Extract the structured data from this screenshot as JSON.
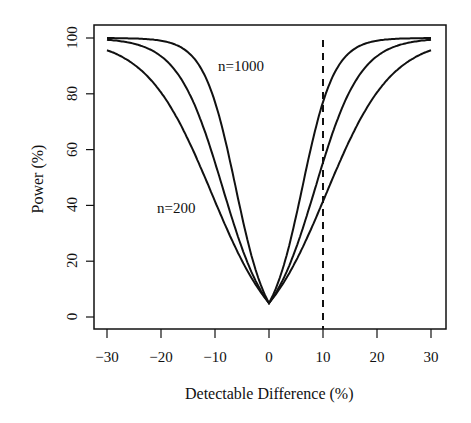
{
  "chart_data": {
    "type": "line",
    "title": "",
    "xlabel": "Detectable Difference (%)",
    "ylabel": "Power (%)",
    "xlim": [
      -31.5,
      33
    ],
    "ylim": [
      -4,
      105
    ],
    "xticks": [
      "-30",
      "-20",
      "-10",
      "0",
      "10",
      "20",
      "30"
    ],
    "yticks": [
      "0",
      "20",
      "40",
      "60",
      "80",
      "100"
    ],
    "grid": false,
    "legend": null,
    "annotations": [
      {
        "text": "n=1000",
        "x": -6,
        "y": 92
      },
      {
        "text": "n=200",
        "x": -13,
        "y": 43
      },
      {
        "type": "vline",
        "x": 10,
        "style": "dashed"
      }
    ],
    "x": [
      -30,
      -25,
      -20,
      -15,
      -10,
      -5,
      0,
      5,
      10,
      15,
      20,
      25,
      30
    ],
    "series": [
      {
        "name": "n=200",
        "values": [
          100,
          99,
          93,
          75,
          50,
          22,
          5,
          22,
          30,
          60,
          90,
          99,
          100
        ]
      },
      {
        "name": "n=500",
        "values": [
          100,
          100,
          100,
          97,
          80,
          40,
          5,
          40,
          62,
          94,
          100,
          100,
          100
        ]
      },
      {
        "name": "n=1000",
        "values": [
          100,
          100,
          100,
          100,
          96,
          60,
          5,
          60,
          88,
          100,
          100,
          100,
          100
        ]
      }
    ]
  }
}
